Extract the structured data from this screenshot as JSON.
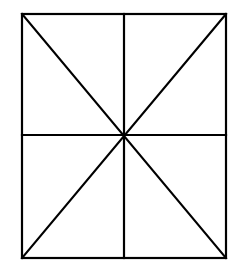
{
  "canvas": {
    "width": 240,
    "height": 273,
    "background": "#ffffff"
  },
  "style": {
    "stroke_color": "#000000",
    "stroke_width": 2.2
  },
  "diagram": {
    "rectangle": {
      "x1": 22,
      "y1": 14,
      "x2": 226,
      "y2": 258
    },
    "center": {
      "x": 124,
      "y": 135
    },
    "segments": [
      {
        "name": "vertical-midline",
        "x1": 124,
        "y1": 14,
        "x2": 124,
        "y2": 258
      },
      {
        "name": "horizontal-midline",
        "x1": 22,
        "y1": 135,
        "x2": 226,
        "y2": 135
      },
      {
        "name": "diagonal-tl-br",
        "x1": 22,
        "y1": 14,
        "x2": 226,
        "y2": 258
      },
      {
        "name": "diagonal-tr-bl",
        "x1": 226,
        "y1": 14,
        "x2": 22,
        "y2": 258
      }
    ],
    "region_count": 8
  }
}
